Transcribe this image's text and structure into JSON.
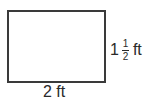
{
  "diagram": {
    "shape": "rectangle",
    "width_label": "2 ft",
    "height_label": {
      "whole": "1",
      "numerator": "1",
      "denominator": "2",
      "unit": "ft"
    }
  }
}
